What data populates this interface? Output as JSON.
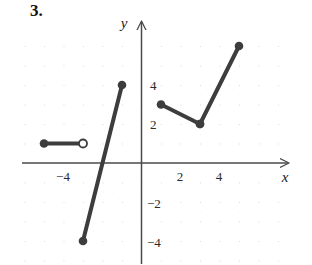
{
  "figure": {
    "problem_number": "3.",
    "caption": ""
  },
  "chart_data": {
    "type": "line",
    "title": "",
    "xlabel": "x",
    "ylabel": "y",
    "xlim": [
      -6.1,
      6.3
    ],
    "ylim": [
      -6.3,
      7.0
    ],
    "xticks": [
      -4,
      2,
      4
    ],
    "xtick_labels": [
      "−4",
      "2",
      "4"
    ],
    "yticks": [
      4,
      2,
      -2,
      -4
    ],
    "ytick_labels": [
      "4",
      "2",
      "−2",
      "−4"
    ],
    "grid": true,
    "grid_spacing": 1,
    "major_grid_spacing": 2,
    "legend": "none",
    "series": [
      {
        "name": "piece-1-constant",
        "points": [
          [
            -5,
            1
          ],
          [
            -3,
            1
          ]
        ],
        "endpoint_markers": [
          "closed",
          "open"
        ],
        "color": "#3d3d3d"
      },
      {
        "name": "piece-2-steep-increasing",
        "points": [
          [
            -3,
            -4
          ],
          [
            -1,
            4
          ]
        ],
        "endpoint_markers": [
          "closed",
          "closed"
        ],
        "color": "#3d3d3d"
      },
      {
        "name": "piece-3-decreasing",
        "points": [
          [
            1,
            3
          ],
          [
            3,
            2
          ]
        ],
        "endpoint_markers": [
          "closed",
          "closed"
        ],
        "color": "#3d3d3d"
      },
      {
        "name": "piece-4-increasing",
        "points": [
          [
            3,
            2
          ],
          [
            5,
            6
          ]
        ],
        "endpoint_markers": [
          "closed",
          "closed"
        ],
        "color": "#3d3d3d"
      }
    ],
    "axis_color": "#4a4a4a",
    "grid_color": "#cfcfcf",
    "curve_color": "#3d3d3d"
  }
}
